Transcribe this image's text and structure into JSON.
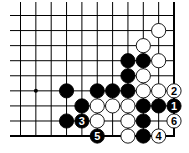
{
  "diagram": {
    "type": "go-board-fragment",
    "corner": "bottom-right",
    "columns_visible": 11,
    "rows_visible": 9,
    "grid": {
      "x0": 20.5,
      "dx": 15.35,
      "y0": 15.5,
      "dy": 15.07
    },
    "line_color": "#000000",
    "black_stone_color": "#000000",
    "white_stone_color": "#ffffff",
    "star_points": [
      {
        "col": 1,
        "row": 5
      }
    ],
    "stones": [
      {
        "color": "white",
        "col": 9,
        "row": 1,
        "label": ""
      },
      {
        "color": "white",
        "col": 8,
        "row": 2,
        "label": ""
      },
      {
        "color": "black",
        "col": 7,
        "row": 3,
        "label": ""
      },
      {
        "color": "black",
        "col": 8,
        "row": 3,
        "label": ""
      },
      {
        "color": "white",
        "col": 9,
        "row": 3,
        "label": ""
      },
      {
        "color": "black",
        "col": 7,
        "row": 4,
        "label": ""
      },
      {
        "color": "white",
        "col": 8,
        "row": 4,
        "label": ""
      },
      {
        "color": "black",
        "col": 3,
        "row": 5,
        "label": ""
      },
      {
        "color": "black",
        "col": 5,
        "row": 5,
        "label": ""
      },
      {
        "color": "black",
        "col": 6,
        "row": 5,
        "label": ""
      },
      {
        "color": "black",
        "col": 7,
        "row": 5,
        "label": ""
      },
      {
        "color": "white",
        "col": 8,
        "row": 5,
        "label": ""
      },
      {
        "color": "white",
        "col": 9,
        "row": 5,
        "label": ""
      },
      {
        "color": "white",
        "col": 10,
        "row": 5,
        "label": "2"
      },
      {
        "color": "black",
        "col": 4,
        "row": 6,
        "label": ""
      },
      {
        "color": "white",
        "col": 5,
        "row": 6,
        "label": ""
      },
      {
        "color": "white",
        "col": 6,
        "row": 6,
        "label": ""
      },
      {
        "color": "white",
        "col": 7,
        "row": 6,
        "label": ""
      },
      {
        "color": "black",
        "col": 8,
        "row": 6,
        "label": ""
      },
      {
        "color": "black",
        "col": 9,
        "row": 6,
        "label": ""
      },
      {
        "color": "black",
        "col": 10,
        "row": 6,
        "label": "1"
      },
      {
        "color": "black",
        "col": 3,
        "row": 7,
        "label": ""
      },
      {
        "color": "black",
        "col": 4,
        "row": 7,
        "label": "3"
      },
      {
        "color": "white",
        "col": 5,
        "row": 7,
        "label": ""
      },
      {
        "color": "white",
        "col": 7,
        "row": 7,
        "label": ""
      },
      {
        "color": "black",
        "col": 8,
        "row": 7,
        "label": ""
      },
      {
        "color": "white",
        "col": 10,
        "row": 7,
        "label": "6"
      },
      {
        "color": "black",
        "col": 5,
        "row": 8,
        "label": "5"
      },
      {
        "color": "white",
        "col": 7,
        "row": 8,
        "label": ""
      },
      {
        "color": "black",
        "col": 8,
        "row": 8,
        "label": ""
      },
      {
        "color": "white",
        "col": 9,
        "row": 8,
        "label": "4"
      }
    ]
  }
}
